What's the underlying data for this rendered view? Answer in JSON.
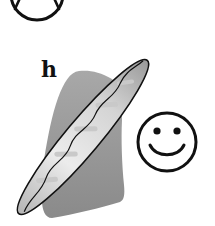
{
  "figure": {
    "label": "h",
    "elements": [
      {
        "name": "frowning-face",
        "partial": true
      },
      {
        "name": "baguette"
      },
      {
        "name": "shadow"
      },
      {
        "name": "smiling-face"
      }
    ]
  },
  "colors": {
    "background": "#ffffff",
    "outline": "#111111",
    "shadow": "#8f8f8f",
    "baguette_light": "#e6e6e6",
    "baguette_dark": "#9a9a9a"
  }
}
